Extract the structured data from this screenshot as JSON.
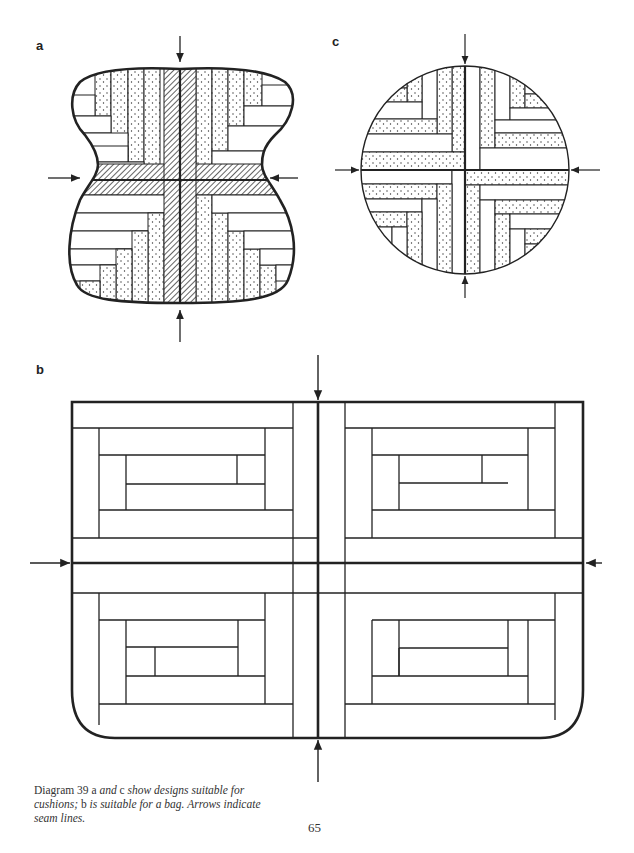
{
  "figure": {
    "labels": {
      "a": "a",
      "b": "b",
      "c": "c"
    },
    "diagram_a": {
      "description": "Double-lobed cushion with hatched seam cross and dotted/plain strips",
      "arrows": 4
    },
    "diagram_b": {
      "description": "Bag panel of four log-cabin blocks, rounded lower corners",
      "arrows": 4
    },
    "diagram_c": {
      "description": "Round cushion with dotted and plain strips, seam cross",
      "arrows": 4
    }
  },
  "caption": {
    "part1": "Diagram 39",
    "part2": "a",
    "part3": "and",
    "part4": "c",
    "part5": "show designs suitable for cushions;",
    "part6": "b",
    "part7": "is suitable for a bag. Arrows indicate seam lines."
  },
  "page_number": "65",
  "colors": {
    "ink": "#222222",
    "paper": "#ffffff"
  }
}
